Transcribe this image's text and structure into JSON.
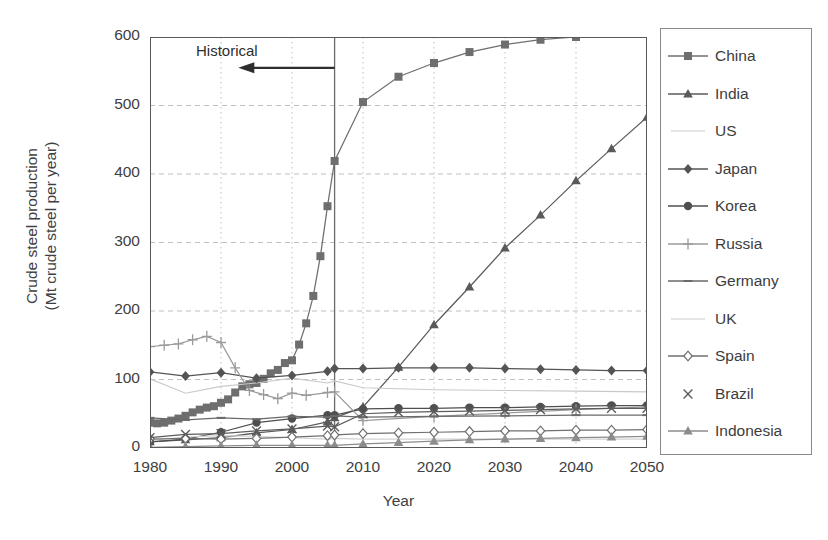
{
  "chart_data": {
    "type": "line",
    "title": "",
    "xlabel": "Year",
    "ylabel": "Crude steel production\n(Mt crude steel per year)",
    "ylabel_line1": "Crude steel production",
    "ylabel_line2": "(Mt crude steel per year)",
    "xlim": [
      1980,
      2050
    ],
    "ylim": [
      0,
      600
    ],
    "yticks": [
      0,
      100,
      200,
      300,
      400,
      500,
      600
    ],
    "xticks": [
      1980,
      1990,
      2000,
      2010,
      2020,
      2030,
      2040,
      2050
    ],
    "grid": "dashed horizontal and dotted vertical gridlines",
    "legend_position": "right outside",
    "annotations": [
      {
        "text": "Historical",
        "type": "arrow-left",
        "x_start": 2006,
        "x_end": 1993,
        "y": 555,
        "note": "Leftward arrow spanning historical period, ending at the 2006 divider line"
      }
    ],
    "divider_line": {
      "x": 2006,
      "label": "historical / projection boundary"
    },
    "units": "Mt crude steel per year",
    "series": [
      {
        "name": "China",
        "marker": "square",
        "color": "#6e6e6e",
        "x": [
          1980,
          1981,
          1982,
          1983,
          1984,
          1985,
          1986,
          1987,
          1988,
          1989,
          1990,
          1991,
          1992,
          1993,
          1994,
          1995,
          1996,
          1997,
          1998,
          1999,
          2000,
          2001,
          2002,
          2003,
          2004,
          2005,
          2006,
          2010,
          2015,
          2020,
          2025,
          2030,
          2035,
          2040,
          2045,
          2050
        ],
        "values": [
          37,
          36,
          37,
          40,
          43,
          47,
          52,
          56,
          59,
          61,
          66,
          71,
          81,
          90,
          93,
          95,
          101,
          109,
          114,
          124,
          128,
          151,
          182,
          222,
          280,
          353,
          419,
          505,
          542,
          562,
          578,
          589,
          596,
          600,
          605,
          608
        ]
      },
      {
        "name": "India",
        "marker": "triangle",
        "color": "#5a5a5a",
        "x": [
          1980,
          1985,
          1990,
          1995,
          2000,
          2005,
          2006,
          2010,
          2015,
          2020,
          2025,
          2030,
          2035,
          2040,
          2045,
          2050
        ],
        "values": [
          9,
          12,
          15,
          22,
          27,
          38,
          44,
          60,
          118,
          180,
          235,
          292,
          340,
          390,
          437,
          483
        ]
      },
      {
        "name": "US",
        "marker": "none-faint",
        "color": "#c9c9c9",
        "x": [
          1980,
          1985,
          1990,
          1995,
          2000,
          2005,
          2006,
          2010,
          2020,
          2030,
          2040,
          2050
        ],
        "values": [
          101,
          80,
          90,
          95,
          102,
          95,
          98,
          88,
          85,
          84,
          83,
          82
        ]
      },
      {
        "name": "Japan",
        "marker": "diamond",
        "color": "#545454",
        "x": [
          1980,
          1985,
          1990,
          1995,
          2000,
          2005,
          2006,
          2010,
          2015,
          2020,
          2025,
          2030,
          2035,
          2040,
          2045,
          2050
        ],
        "values": [
          111,
          105,
          110,
          102,
          106,
          112,
          116,
          116,
          117,
          117,
          117,
          116,
          115,
          114,
          113,
          113
        ]
      },
      {
        "name": "Korea",
        "marker": "circle",
        "color": "#4f4f4f",
        "x": [
          1980,
          1985,
          1990,
          1995,
          2000,
          2005,
          2006,
          2010,
          2015,
          2020,
          2025,
          2030,
          2035,
          2040,
          2045,
          2050
        ],
        "values": [
          9,
          13,
          23,
          37,
          43,
          48,
          48,
          57,
          58,
          58,
          59,
          59,
          60,
          61,
          62,
          62
        ]
      },
      {
        "name": "Russia",
        "marker": "plus",
        "color": "#9a9a9a",
        "x": [
          1980,
          1982,
          1984,
          1986,
          1988,
          1990,
          1992,
          1994,
          1996,
          1998,
          2000,
          2002,
          2005,
          2006,
          2010,
          2020,
          2030,
          2040,
          2050
        ],
        "values": [
          148,
          150,
          152,
          158,
          163,
          154,
          117,
          84,
          78,
          72,
          80,
          77,
          81,
          82,
          40,
          46,
          51,
          56,
          60
        ]
      },
      {
        "name": "Germany",
        "marker": "dash",
        "color": "#6a6a6a",
        "x": [
          1980,
          1985,
          1990,
          1995,
          2000,
          2005,
          2006,
          2010,
          2020,
          2030,
          2040,
          2050
        ],
        "values": [
          44,
          41,
          44,
          42,
          46,
          45,
          47,
          45,
          46,
          47,
          48,
          48
        ]
      },
      {
        "name": "UK",
        "marker": "none-faint",
        "color": "#d2d2d2",
        "x": [
          1980,
          1985,
          1990,
          1995,
          2000,
          2005,
          2006,
          2010,
          2020,
          2030,
          2040,
          2050
        ],
        "values": [
          11,
          16,
          18,
          17,
          15,
          13,
          14,
          13,
          13,
          13,
          13,
          13
        ]
      },
      {
        "name": "Spain",
        "marker": "open-diamond",
        "color": "#707070",
        "x": [
          1980,
          1985,
          1990,
          1995,
          2000,
          2005,
          2006,
          2010,
          2015,
          2020,
          2025,
          2030,
          2035,
          2040,
          2045,
          2050
        ],
        "values": [
          13,
          14,
          13,
          14,
          16,
          18,
          19,
          21,
          22,
          23,
          24,
          25,
          25,
          26,
          26,
          27
        ]
      },
      {
        "name": "Brazil",
        "marker": "x",
        "color": "#5c5c5c",
        "x": [
          1980,
          1985,
          1990,
          1995,
          2000,
          2005,
          2006,
          2010,
          2015,
          2020,
          2025,
          2030,
          2035,
          2040,
          2045,
          2050
        ],
        "values": [
          15,
          20,
          21,
          25,
          28,
          32,
          31,
          50,
          52,
          53,
          54,
          55,
          56,
          57,
          58,
          58
        ]
      },
      {
        "name": "Indonesia",
        "marker": "filled-triangle",
        "color": "#8c8c8c",
        "x": [
          1980,
          1985,
          1990,
          1995,
          2000,
          2005,
          2006,
          2010,
          2015,
          2020,
          2025,
          2030,
          2035,
          2040,
          2045,
          2050
        ],
        "values": [
          1,
          2,
          3,
          4,
          4,
          4,
          4,
          6,
          8,
          10,
          12,
          13,
          14,
          15,
          16,
          17
        ]
      }
    ]
  },
  "axis": {
    "y_title_line1": "Crude steel production",
    "y_title_line2": "(Mt crude steel per year)",
    "x_title": "Year",
    "y_tick_labels": [
      "600",
      "500",
      "400",
      "300",
      "200",
      "100",
      "0"
    ],
    "x_tick_labels": [
      "1980",
      "1990",
      "2000",
      "2010",
      "2020",
      "2030",
      "2040",
      "2050"
    ]
  },
  "annotation": {
    "historical_label": "Historical"
  },
  "legend": {
    "items": [
      {
        "label": "China",
        "marker": "square"
      },
      {
        "label": "India",
        "marker": "triangle"
      },
      {
        "label": "US",
        "marker": "faint-line"
      },
      {
        "label": "Japan",
        "marker": "diamond"
      },
      {
        "label": "Korea",
        "marker": "circle"
      },
      {
        "label": "Russia",
        "marker": "plus"
      },
      {
        "label": "Germany",
        "marker": "dash"
      },
      {
        "label": "UK",
        "marker": "faint-line"
      },
      {
        "label": "Spain",
        "marker": "open-diamond"
      },
      {
        "label": "Brazil",
        "marker": "x"
      },
      {
        "label": "Indonesia",
        "marker": "filled-triangle"
      }
    ]
  },
  "colors": {
    "axis": "#595959",
    "grid": "#b8b8b8",
    "text": "#3d3d3d",
    "china": "#6e6e6e",
    "india": "#5a5a5a",
    "faint": "#cccccc"
  }
}
